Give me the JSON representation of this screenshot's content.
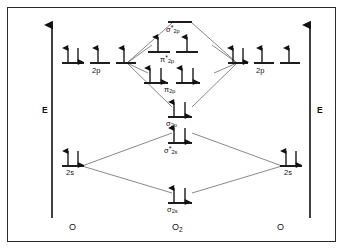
{
  "diagram": {
    "type": "mo-energy-level-diagram",
    "axis": {
      "left_label": "E",
      "right_label": "E",
      "direction": "up",
      "meaning": "energy increasing upward"
    },
    "species": {
      "left_atom": "O",
      "molecule_main": "O",
      "molecule_sub": "2",
      "right_atom": "O"
    },
    "atomic_levels": {
      "left": [
        {
          "name": "2p",
          "label": "2p",
          "orbital_count": 3,
          "electrons": [
            2,
            1,
            1
          ]
        },
        {
          "name": "2s",
          "label": "2s",
          "orbital_count": 1,
          "electrons": [
            2
          ]
        }
      ],
      "right": [
        {
          "name": "2p",
          "label": "2p",
          "orbital_count": 3,
          "electrons": [
            2,
            1,
            1
          ]
        },
        {
          "name": "2s",
          "label": "2s",
          "orbital_count": 1,
          "electrons": [
            2
          ]
        }
      ]
    },
    "molecular_levels": [
      {
        "name": "sigma-star-2p",
        "symbol": "σ",
        "star": "*",
        "sub": "2p",
        "orbital_count": 1,
        "electrons": [
          0
        ]
      },
      {
        "name": "pi-star-2p",
        "symbol": "π",
        "star": "*",
        "sub": "2p",
        "orbital_count": 2,
        "electrons": [
          1,
          1
        ]
      },
      {
        "name": "pi-2p",
        "symbol": "π",
        "star": "",
        "sub": "2p",
        "orbital_count": 2,
        "electrons": [
          2,
          2
        ]
      },
      {
        "name": "sigma-2p",
        "symbol": "σ",
        "star": "",
        "sub": "2p",
        "orbital_count": 1,
        "electrons": [
          2
        ]
      },
      {
        "name": "sigma-star-2s",
        "symbol": "σ",
        "star": "*",
        "sub": "2s",
        "orbital_count": 1,
        "electrons": [
          2
        ]
      },
      {
        "name": "sigma-2s",
        "symbol": "σ",
        "star": "",
        "sub": "2s",
        "orbital_count": 1,
        "electrons": [
          2
        ]
      }
    ],
    "labels": {
      "sigma_star_2p": "σ*2p",
      "pi_star_2p": "π*2p",
      "pi_2p": "π2p",
      "sigma_2p": "σ2p",
      "sigma_star_2s": "σ*2s",
      "sigma_2s": "σ2s",
      "left_2p": "2p",
      "right_2p": "2p",
      "left_2s": "2s",
      "right_2s": "2s",
      "left_atom": "O",
      "right_atom": "O",
      "molecule": "O2"
    },
    "colors": {
      "stroke": "#111111",
      "border": "#2b2b2b",
      "correlation_line": "#555555",
      "background": "#ffffff"
    }
  }
}
